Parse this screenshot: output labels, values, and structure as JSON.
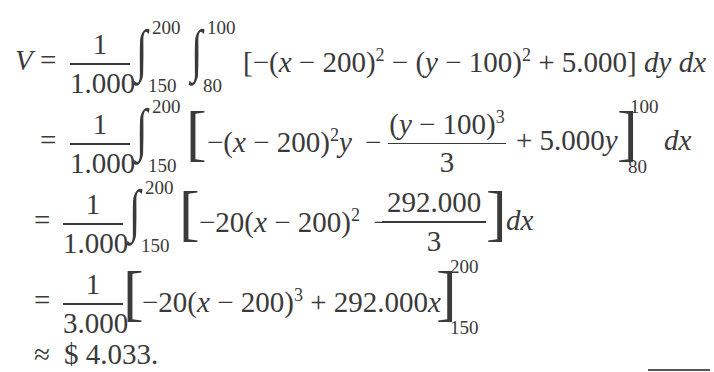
{
  "document": {
    "lines": [
      {
        "lhs": "V",
        "op": "=",
        "frac": {
          "num": "1",
          "den": "1.000"
        },
        "int1": {
          "upper": "200",
          "lower": "150"
        },
        "int2": {
          "upper": "100",
          "lower": "80"
        },
        "body": {
          "open": "[",
          "p1": "−(",
          "x": "x",
          "p2": " − 200)",
          "e1": "2",
          "p3": " − (",
          "y": "y",
          "p4": " − 100)",
          "e2": "2",
          "p5": " + 5.000",
          "close": "]",
          "diff": "dy dx"
        }
      },
      {
        "op": "=",
        "frac": {
          "num": "1",
          "den": "1.000"
        },
        "int": {
          "upper": "200",
          "lower": "150"
        },
        "body": {
          "p1": "−(",
          "x": "x",
          "p2": " − 200)",
          "e1": "2",
          "y": "y",
          "minus": "−",
          "inner_frac": {
            "num_a": "(",
            "num_y": "y",
            "num_b": " − 100)",
            "num_exp": "3",
            "den": "3"
          },
          "p3": "+ 5.000",
          "y2": "y",
          "eval_upper": "100",
          "eval_lower": "80",
          "diff": "dx"
        }
      },
      {
        "op": "=",
        "frac": {
          "num": "1",
          "den": "1.000"
        },
        "int": {
          "upper": "200",
          "lower": "150"
        },
        "body": {
          "p1": "−20(",
          "x": "x",
          "p2": " − 200)",
          "e1": "2",
          "minus": "−",
          "inner_frac": {
            "num": "292.000",
            "den": "3"
          },
          "diff": "dx"
        }
      },
      {
        "op": "=",
        "frac": {
          "num": "1",
          "den": "3.000"
        },
        "body": {
          "p1": "−20(",
          "x": "x",
          "p2": " − 200)",
          "e1": "3",
          "p3": " + 292.000",
          "x2": "x",
          "eval_upper": "200",
          "eval_lower": "150"
        }
      },
      {
        "op": "≈",
        "result": "$ 4.033."
      }
    ]
  }
}
